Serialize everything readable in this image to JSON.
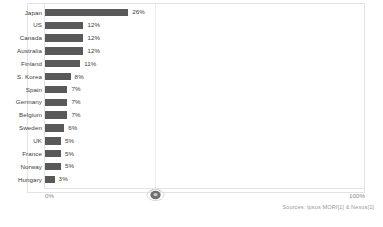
{
  "chart_data": {
    "type": "bar",
    "orientation": "horizontal",
    "title": "",
    "xlabel": "",
    "ylabel": "",
    "xlim": [
      0,
      100
    ],
    "grid": false,
    "legend": null,
    "value_suffix": "%",
    "categories": [
      "Japan",
      "US",
      "Canada",
      "Australia",
      "Finland",
      "S. Korea",
      "Spain",
      "Germany",
      "Belgium",
      "Sweden",
      "UK",
      "France",
      "Norway",
      "Hungary"
    ],
    "values": [
      26,
      12,
      12,
      12,
      11,
      8,
      7,
      7,
      7,
      6,
      5,
      5,
      5,
      3
    ],
    "value_labels": [
      "26%",
      "12%",
      "12%",
      "12%",
      "11%",
      "8%",
      "7%",
      "7%",
      "7%",
      "6%",
      "5%",
      "5%",
      "5%",
      "3%"
    ],
    "bar_color": "#595959",
    "axis_ticks": [
      "0%",
      "100%"
    ],
    "annotations": [
      "Sources: Ipsos MORI[1] & Nexus[1]"
    ]
  },
  "axis": {
    "tick_min": "0%",
    "tick_max": "100%"
  },
  "footer": {
    "source": "Sources: Ipsos MORI[1] & Nexus[1]"
  },
  "marker": {
    "icon": "cursor-marker-icon"
  }
}
